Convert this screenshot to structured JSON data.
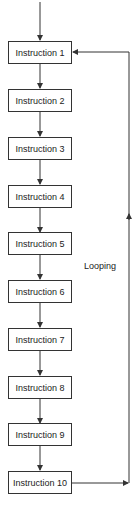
{
  "diagram": {
    "type": "flowchart",
    "steps": [
      {
        "label": "Instruction 1"
      },
      {
        "label": "Instruction 2"
      },
      {
        "label": "Instruction 3"
      },
      {
        "label": "Instruction 4"
      },
      {
        "label": "Instruction 5"
      },
      {
        "label": "Instruction 6"
      },
      {
        "label": "Instruction 7"
      },
      {
        "label": "Instruction 8"
      },
      {
        "label": "Instruction 9"
      },
      {
        "label": "Instruction 10"
      }
    ],
    "loop_label": "Looping",
    "loop": {
      "from": "Instruction 10",
      "to": "Instruction 1"
    },
    "colors": {
      "stroke": "#333333",
      "text": "#222222",
      "background": "#ffffff"
    }
  }
}
